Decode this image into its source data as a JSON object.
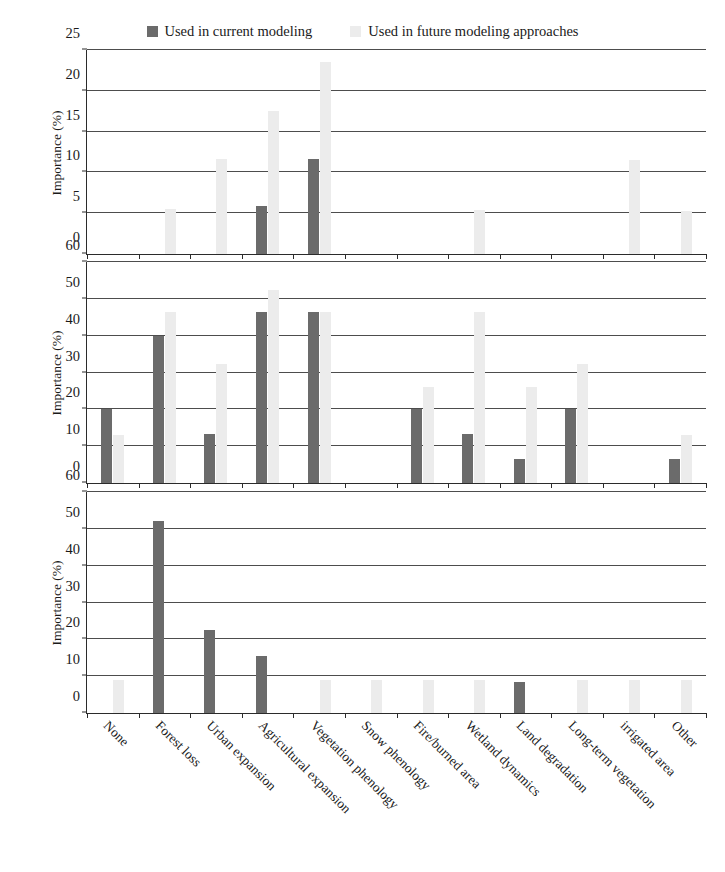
{
  "legend": {
    "entries": [
      {
        "label": "Used in current modeling",
        "icon": "square-swatch-dark",
        "color": "#6b6b6b"
      },
      {
        "label": "Used in future modeling approaches",
        "icon": "square-swatch-light",
        "color": "#ececec"
      }
    ]
  },
  "axis": {
    "ylabel": "Importance (%)"
  },
  "chart_data": {
    "type": "bar",
    "title": "",
    "xlabel": "",
    "ylabel": "Importance (%)",
    "grid": true,
    "legend_position": "top-center",
    "colors": {
      "current": "#6b6b6b",
      "future": "#ececec"
    },
    "categories": [
      "None",
      "Forest loss",
      "Urban expansion",
      "Agricultural expansion",
      "Vegetation phenology",
      "Snow phenology",
      "Fire/burned area",
      "Wetland dynamics",
      "Land degradation",
      "Long-term vegetation",
      "irrigated area",
      "Other"
    ],
    "panels": [
      {
        "index": 1,
        "ylim": [
          0,
          25
        ],
        "yticks": [
          0,
          5,
          10,
          15,
          20,
          25
        ],
        "series": [
          {
            "name": "Used in current modeling",
            "values": [
              0,
              0,
              0,
              5.9,
              11.7,
              0,
              0,
              0,
              0,
              0,
              0,
              0
            ]
          },
          {
            "name": "Used in future modeling approaches",
            "values": [
              0,
              5.5,
              11.6,
              17.5,
              23.5,
              0,
              0,
              5.4,
              0,
              0,
              11.5,
              5.3
            ]
          }
        ]
      },
      {
        "index": 2,
        "ylim": [
          0,
          60
        ],
        "yticks": [
          0,
          10,
          20,
          30,
          40,
          50,
          60
        ],
        "series": [
          {
            "name": "Used in current modeling",
            "values": [
              20,
              40,
              13.3,
              46.3,
              46.3,
              0,
              20,
              13.3,
              6.6,
              20,
              0,
              6.6
            ]
          },
          {
            "name": "Used in future modeling approaches",
            "values": [
              13.1,
              46.3,
              32.3,
              52.5,
              46.3,
              0,
              26,
              46.3,
              26,
              32.3,
              0,
              13.1
            ]
          }
        ]
      },
      {
        "index": 3,
        "ylim": [
          0,
          60
        ],
        "yticks": [
          0,
          10,
          20,
          30,
          40,
          50,
          60
        ],
        "series": [
          {
            "name": "Used in current modeling",
            "values": [
              0,
              52,
              22.5,
              15.5,
              0,
              0,
              0,
              0,
              8.5,
              0,
              0,
              0
            ]
          },
          {
            "name": "Used in future modeling approaches",
            "values": [
              9,
              0,
              0,
              0,
              9,
              9,
              9,
              9,
              0,
              9,
              9,
              9
            ]
          }
        ]
      }
    ]
  }
}
